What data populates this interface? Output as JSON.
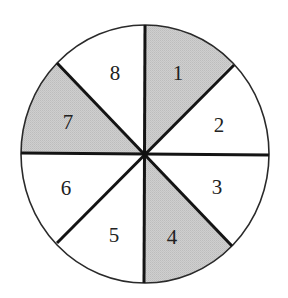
{
  "diagram": {
    "type": "spinner",
    "center": [
      145,
      154
    ],
    "radius_x": 124,
    "radius_y": 129,
    "colors": {
      "shaded": "#c9c9c9",
      "unshaded": "#ffffff",
      "outline": "#1a1a1a"
    },
    "sectors": [
      {
        "label": "1",
        "shaded": true
      },
      {
        "label": "2",
        "shaded": false
      },
      {
        "label": "3",
        "shaded": false
      },
      {
        "label": "4",
        "shaded": true
      },
      {
        "label": "5",
        "shaded": false
      },
      {
        "label": "6",
        "shaded": false
      },
      {
        "label": "7",
        "shaded": true
      },
      {
        "label": "8",
        "shaded": false
      }
    ]
  }
}
